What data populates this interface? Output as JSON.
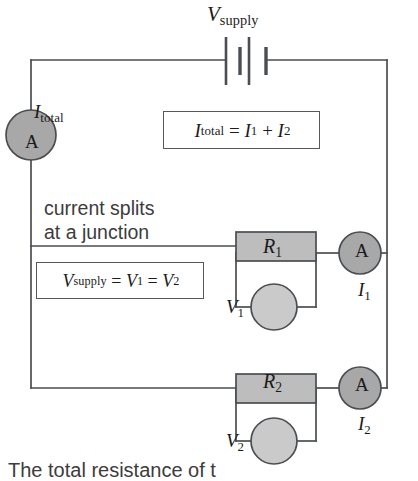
{
  "diagram": {
    "colors": {
      "wire": "#4a4e52",
      "resistor_fill": "#bdbdbd",
      "ammeter_fill": "#a8a8a8",
      "voltmeter_fill": "#cacaca",
      "component_stroke": "#4a4e52",
      "text": "#1b1b1b",
      "annotation_text": "#3c3c3c",
      "background": "#ffffff"
    },
    "supply": {
      "label_symbol": "V",
      "label_subscript": "supply",
      "component": "battery-two-cells"
    },
    "main_line": {
      "current_symbol": "I",
      "current_subscript": "total",
      "ammeter_letter": "A"
    },
    "equations": {
      "current": {
        "lhs_symbol": "I",
        "lhs_subscript": "total",
        "eq1": "=",
        "term1_symbol": "I",
        "term1_subscript": "1",
        "plus": "+",
        "term2_symbol": "I",
        "term2_subscript": "2"
      },
      "voltage": {
        "lhs_symbol": "V",
        "lhs_subscript": "supply",
        "eq1": "=",
        "term1_symbol": "V",
        "term1_subscript": "1",
        "eq2": "=",
        "term2_symbol": "V",
        "term2_subscript": "2"
      }
    },
    "annotations": {
      "split_note_line1": "current splits",
      "split_note_line2": "at a junction",
      "bottom_caption": "The total resistance of t"
    },
    "branches": [
      {
        "resistor_symbol": "R",
        "resistor_subscript": "1",
        "voltmeter_symbol": "V",
        "voltmeter_subscript": "1",
        "ammeter_letter": "A",
        "current_symbol": "I",
        "current_subscript": "1"
      },
      {
        "resistor_symbol": "R",
        "resistor_subscript": "2",
        "voltmeter_symbol": "V",
        "voltmeter_subscript": "2",
        "ammeter_letter": "A",
        "current_symbol": "I",
        "current_subscript": "2"
      }
    ]
  }
}
